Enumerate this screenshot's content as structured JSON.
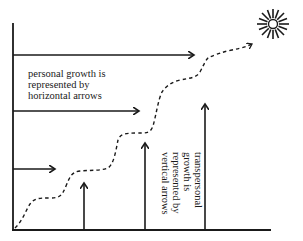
{
  "diagram": {
    "colors": {
      "ink": "#1a1a1a",
      "background": "#ffffff"
    },
    "personal_label": {
      "lines": [
        "personal growth is",
        "represented by",
        "horizontal arrows"
      ]
    },
    "transpersonal_label": {
      "lines": [
        "transpersonal",
        "growth is",
        "represented by",
        "vertical arrows"
      ]
    },
    "axes": {
      "y_axis": "vertical-axis-line",
      "x_axis": "horizontal-axis-line"
    },
    "horizontal_arrows": 3,
    "vertical_arrows": 3,
    "path": "dashed-stepped-growth-curve",
    "goal_icon": "sun-icon"
  }
}
